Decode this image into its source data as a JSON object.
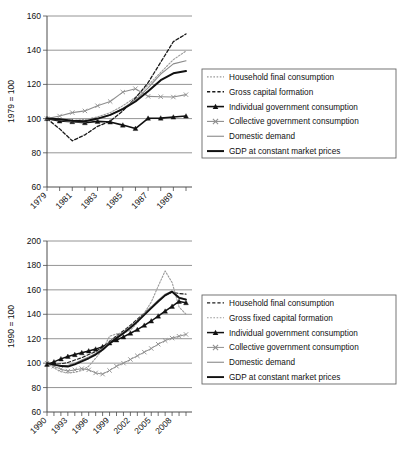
{
  "chart_data": [
    {
      "id": "top",
      "type": "line",
      "title": "",
      "xlabel": "",
      "ylabel": "1979 = 100",
      "ylim": [
        60,
        160
      ],
      "yticks": [
        60,
        80,
        100,
        120,
        140,
        160
      ],
      "grid": true,
      "legend_position": "right",
      "x": [
        1979,
        1980,
        1981,
        1982,
        1983,
        1984,
        1985,
        1986,
        1987,
        1988,
        1989,
        1990
      ],
      "xticklabels": [
        "1979",
        "",
        "1981",
        "",
        "1983",
        "",
        "1985",
        "",
        "1987",
        "",
        "1989",
        ""
      ],
      "series": [
        {
          "name": "Household final consumption",
          "style": "dotted",
          "color": "#9a9a9a",
          "marker": "none",
          "width": 1.1,
          "values": [
            100,
            99.5,
            99.0,
            99.5,
            101.0,
            103.5,
            107.5,
            112.5,
            119.5,
            127.0,
            134.5,
            139.5
          ]
        },
        {
          "name": "Gross capital formation",
          "style": "dashed",
          "color": "#1a1a1a",
          "marker": "none",
          "width": 1.3,
          "values": [
            100,
            94.0,
            87.0,
            90.5,
            95.5,
            98.5,
            104.5,
            112.0,
            121.0,
            133.0,
            145.0,
            149.5
          ]
        },
        {
          "name": "Individual government consumption",
          "style": "solid",
          "color": "#111111",
          "marker": "triangle",
          "width": 1.6,
          "values": [
            100,
            98.6,
            98.2,
            97.6,
            98.4,
            98.0,
            96.2,
            94.2,
            100.2,
            100.3,
            100.9,
            101.5
          ]
        },
        {
          "name": "Collective government consumption",
          "style": "solid",
          "color": "#8f8f8f",
          "marker": "x",
          "width": 1.1,
          "values": [
            100,
            101.5,
            103.5,
            104.5,
            107.5,
            110.0,
            115.5,
            117.5,
            113.0,
            112.8,
            112.6,
            114.0
          ]
        },
        {
          "name": "Domestic demand",
          "style": "solid",
          "color": "#8a8a8a",
          "marker": "none",
          "width": 1.1,
          "values": [
            100,
            99.2,
            98.2,
            98.0,
            99.6,
            102.0,
            106.0,
            111.0,
            118.0,
            126.0,
            132.0,
            133.8
          ]
        },
        {
          "name": "GDP at constant market prices",
          "style": "solid",
          "color": "#111111",
          "marker": "none",
          "width": 2.0,
          "values": [
            100,
            99.6,
            98.7,
            98.4,
            100.0,
            102.2,
            105.5,
            110.0,
            116.0,
            122.5,
            126.5,
            127.8
          ]
        }
      ]
    },
    {
      "id": "bottom",
      "type": "line",
      "title": "",
      "xlabel": "",
      "ylabel": "1990 = 100",
      "ylim": [
        60,
        200
      ],
      "yticks": [
        60,
        80,
        100,
        120,
        140,
        160,
        180,
        200
      ],
      "grid": true,
      "legend_position": "right",
      "x": [
        1990,
        1991,
        1992,
        1993,
        1994,
        1995,
        1996,
        1997,
        1998,
        1999,
        2000,
        2001,
        2002,
        2003,
        2004,
        2005,
        2006,
        2007,
        2008,
        2009,
        2010
      ],
      "xticklabels": [
        "1990",
        "",
        "",
        "1993",
        "",
        "",
        "1996",
        "",
        "",
        "1999",
        "",
        "",
        "2002",
        "",
        "",
        "2005",
        "",
        "",
        "2008",
        "",
        ""
      ],
      "series": [
        {
          "name": "Household final consumption",
          "style": "dashed",
          "color": "#1f1f1f",
          "marker": "none",
          "width": 1.1,
          "values": [
            100,
            99.0,
            99.5,
            100.5,
            102.5,
            104.5,
            107.0,
            109.5,
            113.0,
            117.5,
            122.5,
            126.5,
            131.0,
            136.0,
            141.0,
            146.0,
            151.0,
            155.5,
            158.0,
            157.0,
            156.5
          ]
        },
        {
          "name": "Gross fixed capital formation",
          "style": "dotted",
          "color": "#9c9c9c",
          "marker": "none",
          "width": 1.1,
          "values": [
            100,
            96.0,
            93.0,
            92.0,
            92.5,
            94.0,
            97.5,
            104.0,
            111.0,
            122.0,
            124.0,
            124.5,
            127.0,
            133.0,
            141.0,
            150.0,
            163.0,
            175.5,
            166.0,
            146.0,
            140.0
          ]
        },
        {
          "name": "Individual government consumption",
          "style": "solid",
          "color": "#111111",
          "marker": "triangle",
          "width": 1.5,
          "values": [
            99.0,
            101.0,
            103.5,
            105.5,
            107.0,
            108.5,
            110.0,
            111.5,
            113.5,
            116.5,
            119.0,
            121.5,
            124.5,
            127.5,
            131.0,
            134.5,
            138.5,
            142.5,
            146.5,
            150.5,
            149.5
          ]
        },
        {
          "name": "Collective government consumption",
          "style": "solid",
          "color": "#8f8f8f",
          "marker": "x",
          "width": 1.0,
          "values": [
            100,
            97.5,
            95.0,
            93.5,
            94.5,
            95.5,
            94.5,
            92.0,
            91.0,
            94.0,
            97.5,
            100.0,
            103.0,
            106.0,
            109.0,
            112.0,
            115.5,
            118.5,
            120.5,
            122.0,
            123.5
          ]
        },
        {
          "name": "Domestic demand",
          "style": "solid",
          "color": "#8a8a8a",
          "marker": "none",
          "width": 1.1,
          "values": [
            100,
            98.5,
            98.0,
            98.0,
            100.0,
            102.5,
            105.0,
            108.0,
            112.0,
            117.0,
            121.5,
            125.5,
            130.0,
            135.0,
            140.5,
            146.0,
            151.5,
            156.5,
            159.0,
            154.0,
            152.5
          ]
        },
        {
          "name": "GDP at constant market prices",
          "style": "solid",
          "color": "#111111",
          "marker": "none",
          "width": 1.9,
          "values": [
            100,
            98.8,
            97.6,
            97.2,
            99.0,
            101.5,
            104.0,
            107.0,
            111.0,
            116.0,
            120.5,
            124.5,
            129.0,
            134.0,
            139.5,
            145.0,
            150.5,
            155.5,
            158.5,
            153.5,
            152.0
          ]
        }
      ]
    }
  ]
}
